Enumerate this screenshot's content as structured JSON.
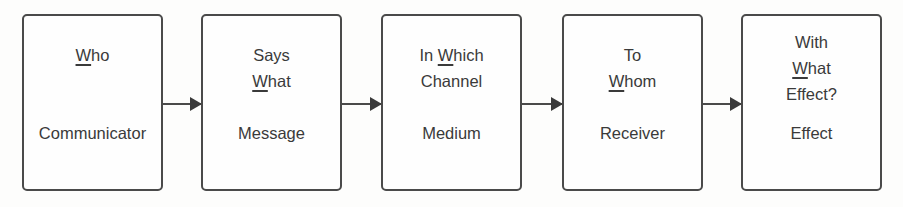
{
  "diagram": {
    "type": "flow",
    "boxes": [
      {
        "question_lines": [
          {
            "u": "W",
            "rest": "ho"
          }
        ],
        "label": "Communicator"
      },
      {
        "question_lines": [
          {
            "pre": "Says"
          },
          {
            "u": "W",
            "rest": "hat"
          }
        ],
        "label": "Message"
      },
      {
        "question_lines": [
          {
            "pre": "In ",
            "u": "W",
            "rest": "hich"
          },
          {
            "pre": "Channel"
          }
        ],
        "label": "Medium"
      },
      {
        "question_lines": [
          {
            "pre": "To"
          },
          {
            "u": "W",
            "rest": "hom"
          }
        ],
        "label": "Receiver"
      },
      {
        "question_lines": [
          {
            "pre": "With"
          },
          {
            "u": "W",
            "rest": "hat"
          },
          {
            "pre": "Effect?"
          }
        ],
        "label": "Effect"
      }
    ],
    "arrows": [
      "Communicator→Message",
      "Message→Medium",
      "Medium→Receiver",
      "Receiver→Effect"
    ]
  }
}
